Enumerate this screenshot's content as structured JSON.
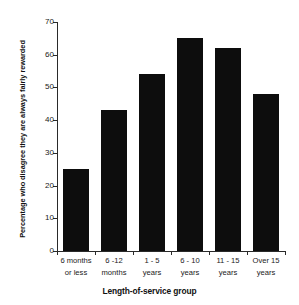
{
  "figure": {
    "cropped_top_title": "",
    "background_color": "#ffffff",
    "bar_color": "#0d0d0d",
    "axis_color": "#2a2a2a"
  },
  "chart_data": {
    "type": "bar",
    "title": "",
    "categories": [
      "6 months or less",
      "6 -12 months",
      "1 - 5 years",
      "6 - 10 years",
      "11 - 15 years",
      "Over 15 years"
    ],
    "category_lines": [
      [
        "6 months",
        "or less"
      ],
      [
        "6 -12",
        "months"
      ],
      [
        "1 - 5",
        "years"
      ],
      [
        "6 - 10",
        "years"
      ],
      [
        "11 - 15",
        "years"
      ],
      [
        "Over 15",
        "years"
      ]
    ],
    "values": [
      25,
      43,
      54,
      65,
      62,
      48
    ],
    "xlabel": "Length-of-service group",
    "ylabel": "Percentage who disagree they are always fairly rewarded",
    "ylim": [
      0,
      70
    ],
    "ytick_values": [
      0,
      10,
      20,
      30,
      40,
      50,
      60,
      70
    ],
    "ytick_labels": [
      "0",
      "10",
      "20",
      "30",
      "40",
      "50",
      "60",
      "70"
    ],
    "grid": false,
    "legend": null,
    "legend_position": "none",
    "bar_color": "#0d0d0d"
  }
}
